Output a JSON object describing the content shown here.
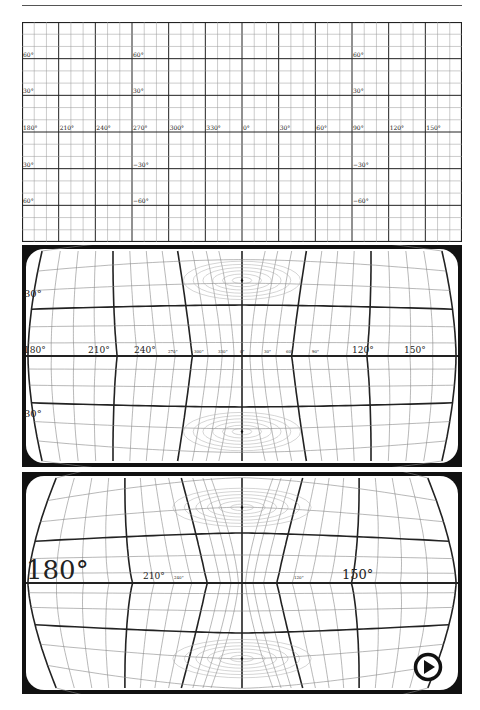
{
  "figure": {
    "panels": [
      {
        "id": "equirectangular",
        "lon_labels": [
          "180°",
          "210°",
          "240°",
          "270°",
          "300°",
          "330°",
          "0°",
          "30°",
          "60°",
          "90°",
          "120°",
          "150°"
        ],
        "lat_labels_left": [
          "60°",
          "30°",
          "30°",
          "60°"
        ],
        "lat_labels_mid": [
          "60°",
          "30°",
          "−30°",
          "−60°"
        ],
        "lat_labels_right": [
          "60°",
          "30°",
          "−30°",
          "−60°"
        ]
      },
      {
        "id": "distorted-1",
        "lon_labels": [
          "180°",
          "210°",
          "240°",
          "270°",
          "300°",
          "330°",
          "0°",
          "30°",
          "60°",
          "90°",
          "120°",
          "150°"
        ],
        "lat_labels": [
          "30°",
          "30°"
        ]
      },
      {
        "id": "distorted-2",
        "lon_labels": [
          "180°",
          "210°",
          "240°",
          "120°",
          "150°"
        ],
        "lat_labels": [
          "30°",
          "30°"
        ]
      }
    ],
    "colors": {
      "major": "#222222",
      "minor": "#888888",
      "fill": "#111111",
      "background": "#ffffff"
    }
  },
  "controls": {
    "play_icon": "play-circle-icon"
  }
}
